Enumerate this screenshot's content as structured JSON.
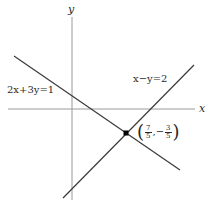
{
  "diagram": {
    "type": "coordinate-plane-line-intersection",
    "axes": {
      "x_label": "x",
      "y_label": "y",
      "color": "#999999"
    },
    "lines": [
      {
        "id": "line1",
        "equation": "2x+3y=1",
        "color": "#3a3a3a"
      },
      {
        "id": "line2",
        "equation": "x−y=2",
        "color": "#3a3a3a"
      }
    ],
    "intersection": {
      "x_num": "7",
      "x_den": "5",
      "y_sign": "−",
      "y_num": "3",
      "y_den": "5",
      "open_paren": "(",
      "close_paren": ")",
      "comma": ",",
      "color": "#000000"
    }
  }
}
